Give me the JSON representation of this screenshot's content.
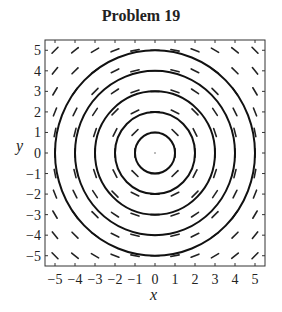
{
  "chart_data": {
    "type": "direction_field_with_contours",
    "title": "Problem 19",
    "xlabel": "x",
    "ylabel": "y",
    "xlim": [
      -5.5,
      5.5
    ],
    "ylim": [
      -5.5,
      5.5
    ],
    "xticks": [
      -5,
      -4,
      -3,
      -2,
      -1,
      0,
      1,
      2,
      3,
      4,
      5
    ],
    "yticks": [
      -5,
      -4,
      -3,
      -2,
      -1,
      0,
      1,
      2,
      3,
      4,
      5
    ],
    "grid": false,
    "field": "dy/dx = -x/y (slope segments at integer grid points)",
    "contour_radii": [
      1,
      2,
      3,
      4,
      5
    ],
    "series": [
      {
        "name": "circle r=1",
        "values": [
          1
        ]
      },
      {
        "name": "circle r=2",
        "values": [
          2
        ]
      },
      {
        "name": "circle r=3",
        "values": [
          3
        ]
      },
      {
        "name": "circle r=4",
        "values": [
          4
        ]
      },
      {
        "name": "circle r=5",
        "values": [
          5
        ]
      }
    ]
  }
}
